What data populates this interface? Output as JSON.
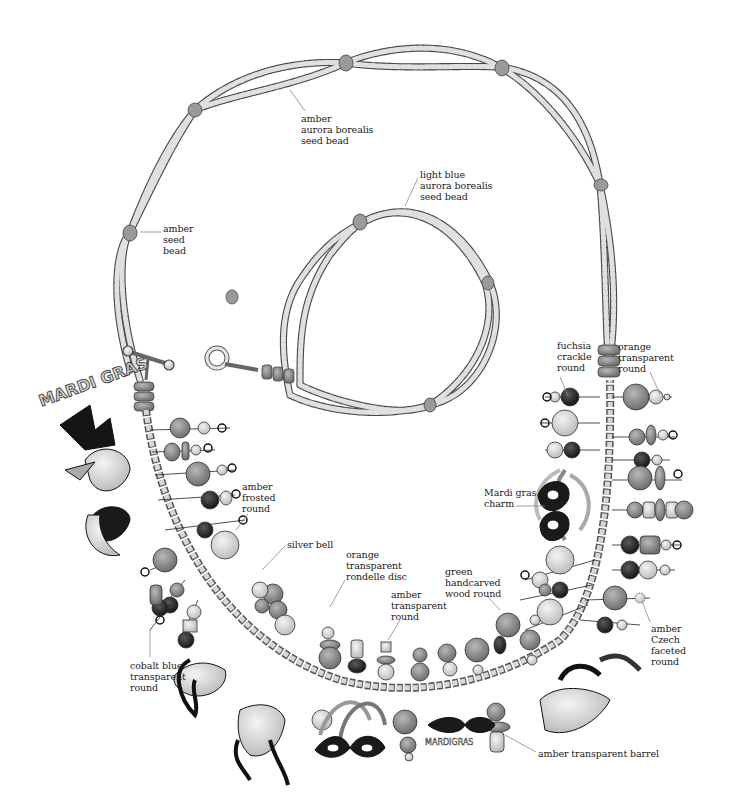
{
  "diagram": {
    "type": "necklace-illustration",
    "colors": {
      "seed_bead": "#d9d9d9",
      "seed_bead_stroke": "#555555",
      "accent_bead": "#9a9a9a",
      "dark_bead": "#2a2a2a",
      "mid_bead": "#8a8a8a",
      "light_bead": "#dcdcdc",
      "chain": "#bdbdbd",
      "leader_line": "#888888",
      "label_text": "#222222"
    },
    "labels": [
      {
        "id": "amber-aurora-borealis-seed-bead",
        "text": "amber\naurora borealis\nseed bead",
        "x": 301,
        "y": 113,
        "line": [
          [
            305,
            111
          ],
          [
            290,
            90
          ]
        ]
      },
      {
        "id": "amber-seed-bead",
        "text": "amber\nseed\nbead",
        "x": 163,
        "y": 223,
        "line": [
          [
            161,
            232
          ],
          [
            140,
            232
          ]
        ]
      },
      {
        "id": "light-blue-aurora-borealis-seed-bead",
        "text": "light blue\naurora borealis\nseed bead",
        "x": 420,
        "y": 169,
        "line": [
          [
            418,
            178
          ],
          [
            405,
            206
          ]
        ]
      },
      {
        "id": "fuchsia-crackle-round",
        "text": "fuchsia\ncrackle\nround",
        "x": 557,
        "y": 340,
        "line": [
          [
            560,
            377
          ],
          [
            568,
            396
          ]
        ]
      },
      {
        "id": "orange-transparent-round",
        "text": "orange\ntransparent\nround",
        "x": 618,
        "y": 341,
        "line": [
          [
            650,
            372
          ],
          [
            660,
            394
          ]
        ]
      },
      {
        "id": "amber-frosted-round",
        "text": "amber\nfrosted\nround",
        "x": 242,
        "y": 481,
        "line": [
          [
            248,
            514
          ],
          [
            236,
            530
          ]
        ]
      },
      {
        "id": "mardi-gras-charm",
        "text": "Mardi gras\ncharm",
        "x": 484,
        "y": 487,
        "line": [
          [
            516,
            506
          ],
          [
            545,
            506
          ]
        ]
      },
      {
        "id": "silver-bell",
        "text": "silver bell",
        "x": 287,
        "y": 539,
        "line": [
          [
            286,
            545
          ],
          [
            262,
            570
          ]
        ]
      },
      {
        "id": "orange-transparent-rondelle-disc",
        "text": "orange\ntransparent\nrondelle disc",
        "x": 346,
        "y": 549,
        "line": [
          [
            345,
            580
          ],
          [
            330,
            607
          ]
        ]
      },
      {
        "id": "green-handcarved-wood-round",
        "text": "green\nhandcarved\nwood round",
        "x": 445,
        "y": 566,
        "line": [
          [
            488,
            597
          ],
          [
            500,
            610
          ]
        ]
      },
      {
        "id": "amber-transparent-round",
        "text": "amber\ntransparent\nround",
        "x": 391,
        "y": 589,
        "line": [
          [
            400,
            620
          ],
          [
            388,
            640
          ]
        ]
      },
      {
        "id": "amber-czech-faceted-round",
        "text": "amber\nCzech\nfaceted\nround",
        "x": 651,
        "y": 623,
        "line": [
          [
            650,
            622
          ],
          [
            642,
            601
          ]
        ]
      },
      {
        "id": "cobalt-blue-transparent-round",
        "text": "cobalt blue\ntransparent\nround",
        "x": 130,
        "y": 660,
        "line": [
          [
            150,
            657
          ],
          [
            150,
            630
          ]
        ]
      },
      {
        "id": "amber-transparent-barrel",
        "text": "amber transparent barrel",
        "x": 538,
        "y": 748,
        "line": [
          [
            536,
            752
          ],
          [
            505,
            735
          ]
        ]
      }
    ]
  }
}
